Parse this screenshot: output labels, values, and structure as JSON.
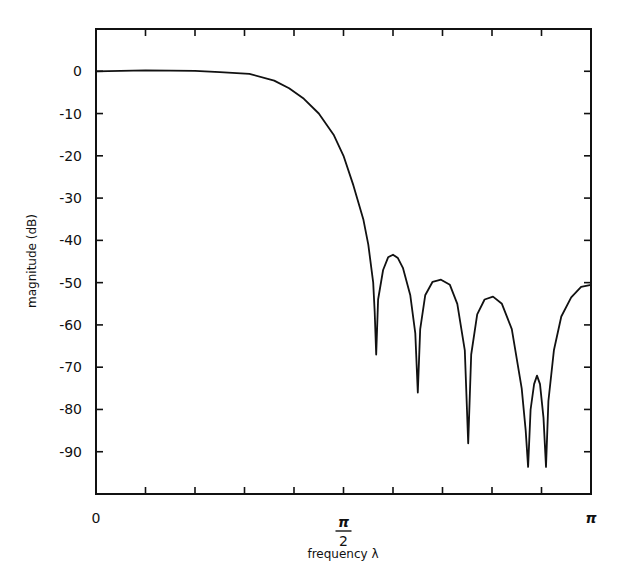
{
  "chart_data": {
    "type": "line",
    "title": "",
    "xlabel": "frequency λ",
    "ylabel": "magnitude (dB)",
    "x_units": "radians (multiples of π)",
    "xlim": [
      0,
      1
    ],
    "ylim": [
      -100,
      10
    ],
    "grid": false,
    "legend": null,
    "x_ticks": {
      "positions": [
        0,
        0.1,
        0.2,
        0.3,
        0.4,
        0.5,
        0.6,
        0.7,
        0.8,
        0.9,
        1.0
      ],
      "labels": [
        {
          "pos": 0,
          "text": "0"
        },
        {
          "pos": 0.5,
          "numerator": "π",
          "denominator": "2"
        },
        {
          "pos": 1.0,
          "text": "π"
        }
      ]
    },
    "y_ticks": [
      0,
      -10,
      -20,
      -30,
      -40,
      -50,
      -60,
      -70,
      -80,
      -90
    ],
    "y_tick_labels": [
      "0",
      "-10",
      "-20",
      "-30",
      "-40",
      "-50",
      "-60",
      "-70",
      "-80",
      "-90"
    ],
    "series": [
      {
        "name": "magnitude response",
        "color": "#111111",
        "x": [
          0,
          0.1,
          0.2,
          0.25,
          0.31,
          0.36,
          0.39,
          0.42,
          0.45,
          0.48,
          0.5,
          0.52,
          0.54,
          0.55,
          0.56,
          0.563,
          0.566,
          0.57,
          0.58,
          0.59,
          0.6,
          0.61,
          0.62,
          0.635,
          0.645,
          0.65,
          0.655,
          0.665,
          0.68,
          0.697,
          0.715,
          0.73,
          0.745,
          0.752,
          0.758,
          0.77,
          0.785,
          0.802,
          0.82,
          0.84,
          0.86,
          0.868,
          0.873,
          0.878,
          0.885,
          0.891,
          0.897,
          0.904,
          0.909,
          0.914,
          0.925,
          0.94,
          0.96,
          0.98,
          1.0
        ],
        "y": [
          0,
          0.2,
          0.1,
          -0.2,
          -0.6,
          -2.2,
          -4,
          -6.5,
          -10,
          -15,
          -20,
          -27,
          -35,
          -41,
          -50,
          -57,
          -67,
          -54,
          -47,
          -44,
          -43.4,
          -44.2,
          -46.5,
          -53,
          -62,
          -76,
          -61,
          -53,
          -49.8,
          -49.3,
          -50.5,
          -55,
          -66,
          -88,
          -67,
          -57.5,
          -54,
          -53.3,
          -55,
          -61,
          -75,
          -85,
          -93.6,
          -80,
          -74,
          -72,
          -74,
          -82,
          -93.6,
          -78,
          -66,
          -58,
          -53.5,
          -51,
          -50.5
        ]
      }
    ],
    "annotations": {
      "nulls": [
        {
          "x": 0.566,
          "y": -67
        },
        {
          "x": 0.65,
          "y": -76
        },
        {
          "x": 0.752,
          "y": -88
        },
        {
          "x": 0.873,
          "y": -93.6
        },
        {
          "x": 0.909,
          "y": -93.6
        }
      ],
      "sidelobe_peaks": [
        {
          "x": 0.6,
          "y": -43.4
        },
        {
          "x": 0.697,
          "y": -49.3
        },
        {
          "x": 0.802,
          "y": -53.3
        },
        {
          "x": 0.891,
          "y": -72
        },
        {
          "x": 1.0,
          "y": -50.5
        }
      ]
    }
  },
  "layout": {
    "plot_box": {
      "left": 96,
      "top": 29,
      "right": 591,
      "bottom": 494
    },
    "line_color": "#111111",
    "background": "#ffffff"
  }
}
